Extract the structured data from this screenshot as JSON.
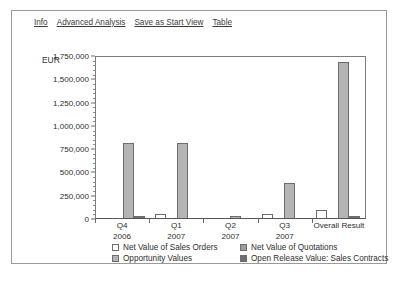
{
  "toolbar": {
    "links": [
      {
        "label": "Info",
        "name": "info-link"
      },
      {
        "label": "Advanced Analysis",
        "name": "advanced-analysis-link"
      },
      {
        "label": "Save as Start View",
        "name": "save-as-start-view-link"
      },
      {
        "label": "Table",
        "name": "table-link"
      }
    ]
  },
  "chart_data": {
    "type": "bar",
    "title": "",
    "xlabel": "",
    "ylabel": "EUR",
    "unit_label": "EUR",
    "ylim": [
      0,
      1750000
    ],
    "ytick_step": 250000,
    "grid": false,
    "legend_position": "bottom",
    "categories": [
      "Q4\n2006",
      "Q1\n2007",
      "Q2\n2007",
      "Q3\n2007",
      "Overall Result"
    ],
    "category_lines": [
      [
        "Q4",
        "2006"
      ],
      [
        "Q1",
        "2007"
      ],
      [
        "Q2",
        "2007"
      ],
      [
        "Q3",
        "2007"
      ],
      [
        "Overall Result",
        ""
      ]
    ],
    "ytick_labels": [
      "1,750,000",
      "1,500,000",
      "1,250,000",
      "1,000,000",
      "750,000",
      "500,000",
      "250,000",
      "0"
    ],
    "ytick_values": [
      1750000,
      1500000,
      1250000,
      1000000,
      750000,
      500000,
      250000,
      0
    ],
    "series": [
      {
        "name": "Net Value of Sales Orders",
        "color": "#ffffff",
        "values": [
          0,
          42000,
          0,
          40000,
          82000
        ]
      },
      {
        "name": "Net Value of Quotations",
        "color": "#9d9d9d",
        "values": [
          0,
          0,
          0,
          0,
          0
        ]
      },
      {
        "name": "Opportunity Values",
        "color": "#b4b4b4",
        "values": [
          805000,
          810000,
          12000,
          380000,
          1680000
        ]
      },
      {
        "name": "Open Release Value: Sales Contracts",
        "color": "#6f6f6f",
        "values": [
          18000,
          0,
          0,
          0,
          18000
        ]
      }
    ]
  },
  "legend": {
    "entries": [
      "Net Value of Sales Orders",
      "Net Value of Quotations",
      "Opportunity Values",
      "Open Release Value: Sales Contracts"
    ]
  }
}
